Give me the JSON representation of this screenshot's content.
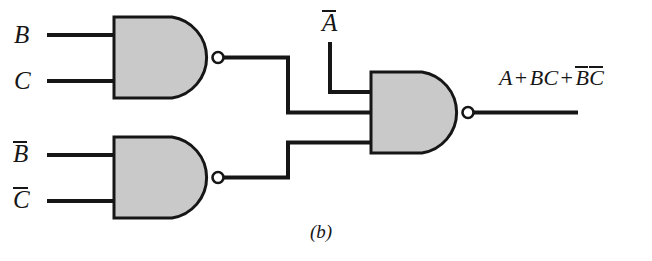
{
  "figure": {
    "caption": "(b)",
    "background_color": "#ffffff",
    "line_color": "#161616",
    "gate_fill_color": "#c9c9c9"
  },
  "inputs": [
    {
      "id": "in-b",
      "label": "B",
      "overbar": false,
      "gate": "nand-1",
      "pin": 1
    },
    {
      "id": "in-c",
      "label": "C",
      "overbar": false,
      "gate": "nand-1",
      "pin": 2
    },
    {
      "id": "in-b-not",
      "label": "B",
      "overbar": true,
      "gate": "nand-2",
      "pin": 1
    },
    {
      "id": "in-c-not",
      "label": "C",
      "overbar": true,
      "gate": "nand-2",
      "pin": 2
    },
    {
      "id": "in-a-not",
      "label": "A",
      "overbar": true,
      "gate": "nand-3",
      "pin": 1
    }
  ],
  "gates": [
    {
      "id": "nand-1",
      "type": "NAND",
      "inputs": 2,
      "input_labels": [
        "B",
        "C"
      ]
    },
    {
      "id": "nand-2",
      "type": "NAND",
      "inputs": 2,
      "input_labels": [
        "B-bar",
        "C-bar"
      ]
    },
    {
      "id": "nand-3",
      "type": "NAND",
      "inputs": 3,
      "input_labels": [
        "A-bar",
        "nand-1-out",
        "nand-2-out"
      ]
    }
  ],
  "wires": [
    {
      "id": "wire-nand1-to-nand3",
      "from": "nand-1-output",
      "to": "nand-3-input-2"
    },
    {
      "id": "wire-nand2-to-nand3",
      "from": "nand-2-output",
      "to": "nand-3-input-3"
    },
    {
      "id": "wire-anot-to-nand3",
      "from": "in-a-not",
      "to": "nand-3-input-1"
    },
    {
      "id": "wire-output",
      "from": "nand-3-output",
      "to": "output-expression"
    }
  ],
  "output": {
    "expression_plain": "A + BC + B̄C̄",
    "terms": [
      {
        "text": "A",
        "overbar": false
      },
      {
        "text": "BC",
        "overbar": false
      },
      {
        "text": "B",
        "overbar": true
      },
      {
        "text": "C",
        "overbar": true
      }
    ],
    "operator": "+"
  }
}
